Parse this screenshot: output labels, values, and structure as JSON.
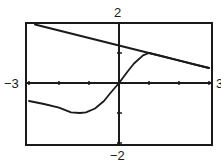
{
  "chart_data": {
    "type": "line",
    "title": "",
    "xlabel": "",
    "ylabel": "",
    "xlim": [
      -3,
      3
    ],
    "ylim": [
      -2,
      2
    ],
    "x_tick_step": 1,
    "y_tick_step": 1,
    "grid": false,
    "legend": null,
    "window_labels": {
      "xmin": "−3",
      "xmax": "3",
      "ymin": "−2",
      "ymax": "2"
    },
    "series": [
      {
        "name": "line",
        "style": "straight line, slope approx -0.25",
        "x": [
          -2.8,
          -2,
          -1,
          0,
          1,
          2,
          3
        ],
        "y": [
          1.95,
          1.75,
          1.5,
          1.25,
          1.0,
          0.75,
          0.5
        ]
      },
      {
        "name": "curve",
        "style": "sigmoid-like curve through origin, tangent to line near x=1",
        "x": [
          -3,
          -2.5,
          -2,
          -1.6,
          -1.3,
          -1.1,
          -0.8,
          -0.5,
          -0.3,
          0,
          0.3,
          0.5,
          0.8,
          1.0,
          1.5,
          2,
          2.5,
          3
        ],
        "y": [
          -0.6,
          -0.7,
          -0.82,
          -0.98,
          -1.0,
          -0.98,
          -0.85,
          -0.6,
          -0.35,
          0,
          0.4,
          0.65,
          0.92,
          1.0,
          0.88,
          0.75,
          0.62,
          0.5
        ]
      }
    ]
  },
  "colors": {
    "ink": "#1a1a1a",
    "background": "#ffffff"
  }
}
